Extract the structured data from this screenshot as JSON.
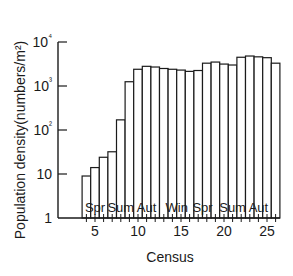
{
  "chart_data": {
    "type": "bar",
    "title": "",
    "xlabel": "Census",
    "ylabel": "Population density(numbers/m²)",
    "yscale": "log",
    "ylim": [
      1,
      10000
    ],
    "y_ticks": [
      "1",
      "10",
      "10²",
      "10³",
      "10⁴"
    ],
    "y_tick_values": [
      1,
      10,
      100,
      1000,
      10000
    ],
    "x_ticks": [
      "5",
      "10",
      "15",
      "20",
      "25"
    ],
    "x_tick_values": [
      5,
      10,
      15,
      20,
      25
    ],
    "categories": [
      4,
      5,
      6,
      7,
      8,
      9,
      10,
      11,
      12,
      13,
      14,
      15,
      16,
      17,
      18,
      19,
      20,
      21,
      22,
      23,
      24,
      25,
      26
    ],
    "values": [
      9,
      14,
      24,
      32,
      170,
      1250,
      2400,
      2800,
      2700,
      2500,
      2400,
      2300,
      2150,
      2250,
      3300,
      3500,
      3150,
      3000,
      4500,
      4800,
      4600,
      4400,
      3300
    ],
    "annotations": [
      {
        "text": "Spr",
        "x": 5
      },
      {
        "text": "Sum",
        "x": 8
      },
      {
        "text": "Aut",
        "x": 11
      },
      {
        "text": "Win",
        "x": 14.5
      },
      {
        "text": "Spr",
        "x": 17.5
      },
      {
        "text": "Sum",
        "x": 21
      },
      {
        "text": "Aut",
        "x": 24
      }
    ],
    "grid": false,
    "legend": null,
    "bar_fill": "#ffffff",
    "bar_edge": "#1a1a1a"
  }
}
